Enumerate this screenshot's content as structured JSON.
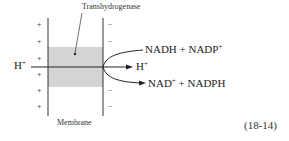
{
  "diagram": {
    "enzyme_label": "Transhydrogenase",
    "membrane_label": "Membrane",
    "left_charges": [
      "+",
      "+",
      "+",
      "+",
      "+",
      "+"
    ],
    "right_charges": [
      "−",
      "−",
      "−",
      "−",
      "−",
      "−"
    ],
    "proton_in": {
      "base": "H",
      "sup": "+"
    },
    "proton_out": {
      "base": "H",
      "sup": "+"
    },
    "reactants": {
      "a": "NADH + NADP",
      "a_sup": "+"
    },
    "products": {
      "a": "NAD",
      "a_sup": "+",
      "b": " + NADPH"
    },
    "equation_number": "(18-14)",
    "colors": {
      "shade": "#d4d4d4",
      "line": "#333333"
    }
  }
}
